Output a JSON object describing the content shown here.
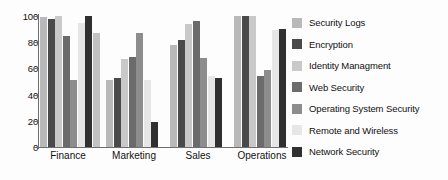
{
  "chart_data": {
    "type": "bar",
    "title": "",
    "xlabel": "",
    "ylabel": "",
    "ylim": [
      0,
      100
    ],
    "yticks": [
      0,
      20,
      40,
      60,
      80,
      100
    ],
    "grid": false,
    "legend_position": "right",
    "categories": [
      "Finance",
      "Marketing",
      "Sales",
      "Operations"
    ],
    "series": [
      {
        "name": "Security Logs",
        "color": "#b9b9b9",
        "values": [
          99,
          51,
          78,
          100
        ]
      },
      {
        "name": "Encryption",
        "color": "#4a4a4a",
        "values": [
          98,
          53,
          82,
          100
        ]
      },
      {
        "name": "Identity Managment",
        "color": "#c9c9c9",
        "values": [
          100,
          67,
          94,
          100
        ]
      },
      {
        "name": "Web Security",
        "color": "#6b6b6b",
        "values": [
          85,
          69,
          96,
          54
        ]
      },
      {
        "name": "Operating System Security",
        "color": "#8d8d8d",
        "values": [
          51,
          87,
          68,
          59
        ]
      },
      {
        "name": "Remote and Wireless",
        "color": "#e6e6e6",
        "values": [
          95,
          51,
          54,
          89
        ]
      },
      {
        "name": "Network Security",
        "color": "#303030",
        "values": [
          100,
          19,
          53,
          90
        ]
      }
    ],
    "trailing_values": [
      87,
      0,
      0,
      0
    ]
  },
  "axis": {
    "y_tick_labels": [
      "100",
      "80",
      "60",
      "40",
      "20",
      "0"
    ]
  }
}
